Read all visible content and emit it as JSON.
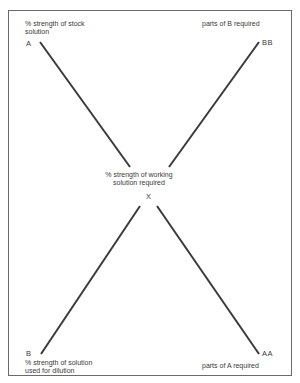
{
  "diagram": {
    "type": "dilution cross (rule of alligation)",
    "labels": {
      "top_left_desc_line1": "% strength of stock",
      "top_left_desc_line2": "solution",
      "top_left_point": "A",
      "top_right_desc": "parts of B required",
      "top_right_point": "BB",
      "center_desc_line1": "% strength of working",
      "center_desc_line2": "solution required",
      "center_point": "X",
      "bottom_left_point": "B",
      "bottom_left_desc_line1": "% strength of solution",
      "bottom_left_desc_line2": "used  for dilution",
      "bottom_right_point": "AA",
      "bottom_right_desc": "parts of A required"
    },
    "colors": {
      "line": "#3a3a3a",
      "text": "#3a3a3a",
      "frame": "#6a6a6a"
    }
  }
}
